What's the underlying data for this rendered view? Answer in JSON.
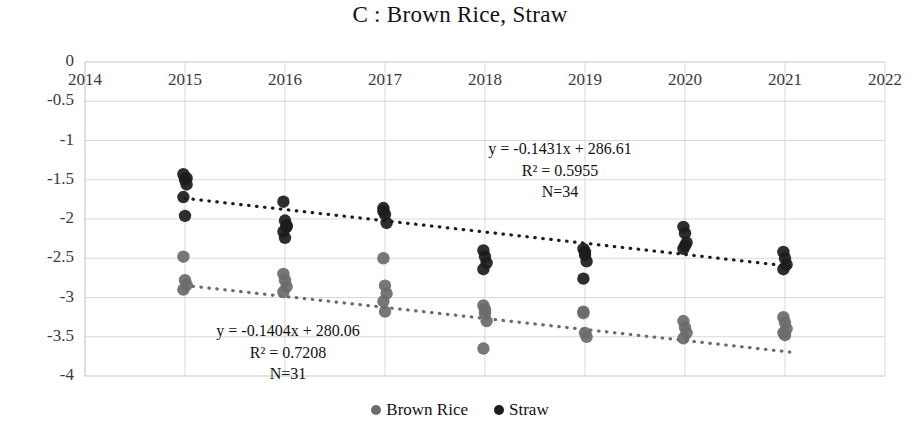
{
  "chart_data": {
    "type": "scatter",
    "title": "C : Brown Rice, Straw",
    "xlabel": "",
    "ylabel": "",
    "xlim": [
      2014,
      2022
    ],
    "ylim": [
      -4,
      0
    ],
    "xticks": [
      "2014",
      "2015",
      "2016",
      "2017",
      "2018",
      "2019",
      "2020",
      "2021",
      "2022"
    ],
    "yticks": [
      "0",
      "-0.5",
      "-1",
      "-1.5",
      "-2",
      "-2.5",
      "-3",
      "-3.5",
      "-4"
    ],
    "grid": true,
    "legend_position": "bottom",
    "series": [
      {
        "name": "Brown Rice",
        "color": "#6b6b6b",
        "marker": "circle",
        "points": [
          [
            2015,
            -2.48
          ],
          [
            2015,
            -2.78
          ],
          [
            2015,
            -2.84
          ],
          [
            2015,
            -2.9
          ],
          [
            2016,
            -2.7
          ],
          [
            2016,
            -2.78
          ],
          [
            2016,
            -2.86
          ],
          [
            2016,
            -2.93
          ],
          [
            2017,
            -2.5
          ],
          [
            2017,
            -2.85
          ],
          [
            2017,
            -2.95
          ],
          [
            2017,
            -3.05
          ],
          [
            2017,
            -3.18
          ],
          [
            2018,
            -3.1
          ],
          [
            2018,
            -3.2
          ],
          [
            2018,
            -3.3
          ],
          [
            2018,
            -3.65
          ],
          [
            2019,
            -3.2
          ],
          [
            2019,
            -3.45
          ],
          [
            2019,
            -3.5
          ],
          [
            2020,
            -3.3
          ],
          [
            2020,
            -3.38
          ],
          [
            2020,
            -3.45
          ],
          [
            2020,
            -3.52
          ],
          [
            2021,
            -3.25
          ],
          [
            2021,
            -3.32
          ],
          [
            2021,
            -3.4
          ],
          [
            2021,
            -3.45
          ],
          [
            2021,
            -3.48
          ],
          [
            2019,
            -3.18
          ],
          [
            2018,
            -3.15
          ]
        ],
        "trendline": {
          "equation": "y = -0.1404x + 280.06",
          "slope": -0.1404,
          "intercept": 280.06,
          "r2": 0.7208,
          "n": 31,
          "x_start": 2015,
          "x_end": 2021.05,
          "style": "dotted"
        }
      },
      {
        "name": "Straw",
        "color": "#1c1c1c",
        "marker": "circle",
        "points": [
          [
            2015,
            -1.43
          ],
          [
            2015,
            -1.5
          ],
          [
            2015,
            -1.56
          ],
          [
            2015,
            -1.72
          ],
          [
            2015,
            -1.96
          ],
          [
            2016,
            -1.78
          ],
          [
            2016,
            -2.02
          ],
          [
            2016,
            -2.1
          ],
          [
            2016,
            -2.16
          ],
          [
            2016,
            -2.24
          ],
          [
            2017,
            -1.86
          ],
          [
            2017,
            -1.94
          ],
          [
            2017,
            -2.05
          ],
          [
            2018,
            -2.4
          ],
          [
            2018,
            -2.48
          ],
          [
            2018,
            -2.56
          ],
          [
            2018,
            -2.64
          ],
          [
            2019,
            -2.38
          ],
          [
            2019,
            -2.46
          ],
          [
            2019,
            -2.54
          ],
          [
            2019,
            -2.76
          ],
          [
            2020,
            -2.1
          ],
          [
            2020,
            -2.18
          ],
          [
            2020,
            -2.3
          ],
          [
            2020,
            -2.38
          ],
          [
            2021,
            -2.42
          ],
          [
            2021,
            -2.5
          ],
          [
            2021,
            -2.58
          ],
          [
            2021,
            -2.64
          ],
          [
            2015,
            -1.48
          ],
          [
            2016,
            -2.08
          ],
          [
            2017,
            -1.9
          ],
          [
            2019,
            -2.42
          ],
          [
            2020,
            -2.34
          ]
        ],
        "trendline": {
          "equation": "y = -0.1431x + 286.61",
          "slope": -0.1431,
          "intercept": 286.61,
          "r2": 0.5955,
          "n": 34,
          "x_start": 2015,
          "x_end": 2021.05,
          "style": "dotted"
        }
      }
    ],
    "annotations": [
      {
        "id": "straw-stats",
        "lines": [
          "y = -0.1431x + 286.61",
          "R² = 0.5955",
          "N=34"
        ],
        "x_px": 560,
        "y_px": 138
      },
      {
        "id": "brownrice-stats",
        "lines": [
          "y = -0.1404x + 280.06",
          "R² = 0.7208",
          "N=31"
        ],
        "x_px": 288,
        "y_px": 320
      }
    ]
  },
  "legend": {
    "items": [
      {
        "label": "Brown Rice",
        "color": "#6b6b6b"
      },
      {
        "label": "Straw",
        "color": "#1c1c1c"
      }
    ]
  },
  "colors": {
    "grid": "#d9d9d9",
    "axis": "#bfbfbf",
    "text": "#3a3a3a",
    "brown_rice": "#6b6b6b",
    "straw": "#1c1c1c"
  }
}
